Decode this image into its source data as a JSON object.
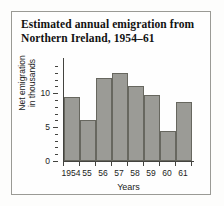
{
  "figure": {
    "title_line1": "Estimated annual emigration from",
    "title_line2": "Northern Ireland, 1954–61",
    "border_color": "#9a9a95",
    "bar_fill": "#9b9b96",
    "bar_edge": "#67675f",
    "axis_color": "#43433f",
    "background": "#fefefe"
  },
  "axis_titles": {
    "y_line1": "Net emigration",
    "y_line2": "in thousands",
    "x": "Years"
  },
  "chart_data": {
    "type": "bar",
    "title": "Estimated annual emigration from Northern Ireland, 1954–61",
    "categories": [
      "1954",
      "55",
      "56",
      "57",
      "58",
      "59",
      "60",
      "61"
    ],
    "values": [
      9.4,
      6.1,
      12.2,
      13.0,
      11.0,
      9.7,
      4.4,
      8.7
    ],
    "xlabel": "Years",
    "ylabel": "Net emigration in thousands",
    "ylim": [
      0,
      14.9
    ],
    "yticks": [
      0,
      5,
      10
    ],
    "ytick_labels": [
      "0",
      "5",
      "10"
    ],
    "yminor_step": 1,
    "grid": false,
    "legend": false
  }
}
